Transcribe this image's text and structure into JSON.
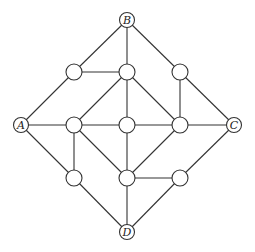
{
  "diagram": {
    "type": "graph",
    "nodes": [
      {
        "id": "B",
        "label": "B",
        "x": 127,
        "y": 20,
        "r": 7.5
      },
      {
        "id": "A",
        "label": "A",
        "x": 21,
        "y": 125,
        "r": 7.5
      },
      {
        "id": "C",
        "label": "C",
        "x": 234,
        "y": 125,
        "r": 7.5
      },
      {
        "id": "D",
        "label": "D",
        "x": 127,
        "y": 232,
        "r": 7.5
      },
      {
        "id": "n1",
        "label": "",
        "x": 74,
        "y": 72,
        "r": 8
      },
      {
        "id": "n2",
        "label": "",
        "x": 127,
        "y": 72,
        "r": 8
      },
      {
        "id": "n3",
        "label": "",
        "x": 180,
        "y": 72,
        "r": 8
      },
      {
        "id": "n4",
        "label": "",
        "x": 74,
        "y": 125,
        "r": 8
      },
      {
        "id": "n5",
        "label": "",
        "x": 127,
        "y": 125,
        "r": 8
      },
      {
        "id": "n6",
        "label": "",
        "x": 180,
        "y": 125,
        "r": 8
      },
      {
        "id": "n7",
        "label": "",
        "x": 74,
        "y": 178,
        "r": 8
      },
      {
        "id": "n8",
        "label": "",
        "x": 127,
        "y": 178,
        "r": 8
      },
      {
        "id": "n9",
        "label": "",
        "x": 180,
        "y": 178,
        "r": 8
      }
    ],
    "edges": [
      [
        "B",
        "n1"
      ],
      [
        "B",
        "n2"
      ],
      [
        "B",
        "n3"
      ],
      [
        "n1",
        "n2"
      ],
      [
        "n1",
        "A"
      ],
      [
        "n2",
        "n4"
      ],
      [
        "n2",
        "n5"
      ],
      [
        "n2",
        "n6"
      ],
      [
        "n3",
        "n6"
      ],
      [
        "n3",
        "C"
      ],
      [
        "A",
        "n4"
      ],
      [
        "n4",
        "n5"
      ],
      [
        "n5",
        "n6"
      ],
      [
        "n6",
        "C"
      ],
      [
        "A",
        "n7"
      ],
      [
        "n4",
        "n7"
      ],
      [
        "n4",
        "n8"
      ],
      [
        "n5",
        "n8"
      ],
      [
        "n6",
        "n8"
      ],
      [
        "n8",
        "n9"
      ],
      [
        "C",
        "n9"
      ],
      [
        "n7",
        "D"
      ],
      [
        "n8",
        "D"
      ],
      [
        "n9",
        "D"
      ]
    ]
  }
}
